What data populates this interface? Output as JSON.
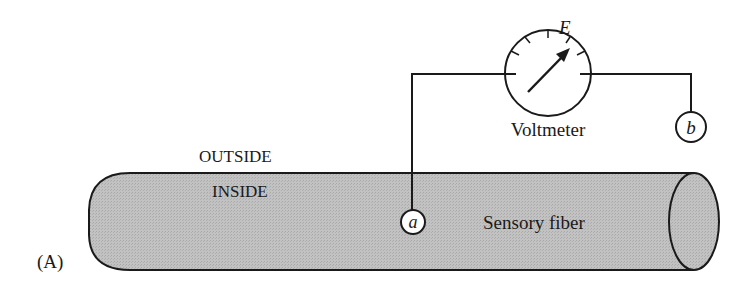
{
  "figure": {
    "panel_label": "(A)",
    "outside_label": "OUTSIDE",
    "inside_label": "INSIDE",
    "fiber_label": "Sensory fiber",
    "voltmeter_label": "Voltmeter",
    "voltage_symbol": "E",
    "electrode_a": "a",
    "electrode_b": "b"
  },
  "colors": {
    "fiber_fill": "#bdbdbd",
    "stroke": "#1a1a1a",
    "background": "#ffffff"
  }
}
